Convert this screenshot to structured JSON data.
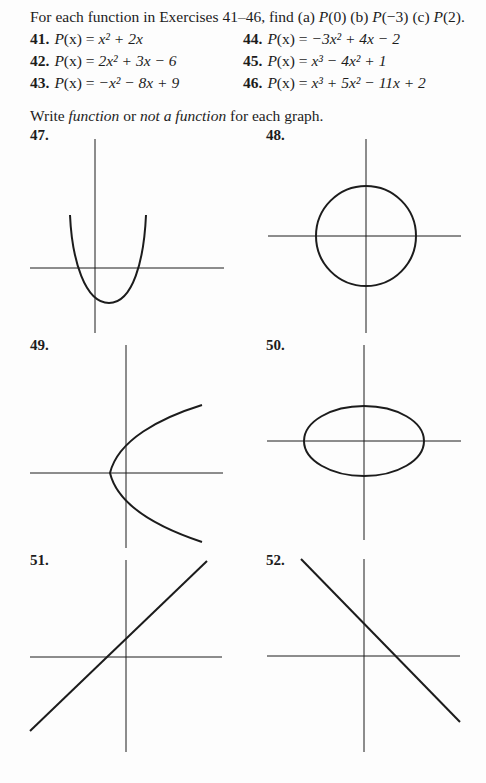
{
  "intro": {
    "prefix": "For each function in Exercises 41–46, find ",
    "parts": [
      "(a) ",
      "P",
      "(0) ",
      "(b) ",
      "P",
      "(−3) ",
      "(c) ",
      "P",
      "(2)."
    ]
  },
  "exercises": [
    {
      "num": "41.",
      "lhs": "P",
      "arg": "(x) = ",
      "rhs": "x² + 2x"
    },
    {
      "num": "42.",
      "lhs": "P",
      "arg": "(x) = ",
      "rhs": "2x² + 3x − 6"
    },
    {
      "num": "43.",
      "lhs": "P",
      "arg": "(x) = ",
      "rhs": "−x² − 8x + 9"
    },
    {
      "num": "44.",
      "lhs": "P",
      "arg": "(x) = ",
      "rhs": "−3x² + 4x − 2"
    },
    {
      "num": "45.",
      "lhs": "P",
      "arg": "(x) = ",
      "rhs": "x³ − 4x² + 1"
    },
    {
      "num": "46.",
      "lhs": "P",
      "arg": "(x) = ",
      "rhs": "x³ + 5x² − 11x + 2"
    }
  ],
  "instruction": {
    "w1": "Write ",
    "i1": "function",
    "w2": " or ",
    "i2": "not a function",
    "w3": " for each graph."
  },
  "graphs": [
    {
      "label": "47.",
      "shape": "parabola-up"
    },
    {
      "label": "48.",
      "shape": "circle"
    },
    {
      "label": "49.",
      "shape": "parabola-right"
    },
    {
      "label": "50.",
      "shape": "ellipse"
    },
    {
      "label": "51.",
      "shape": "line-increasing"
    },
    {
      "label": "52.",
      "shape": "line-decreasing"
    }
  ],
  "colors": {
    "ink": "#1c1c1c",
    "paper": "#fdfdfd"
  }
}
